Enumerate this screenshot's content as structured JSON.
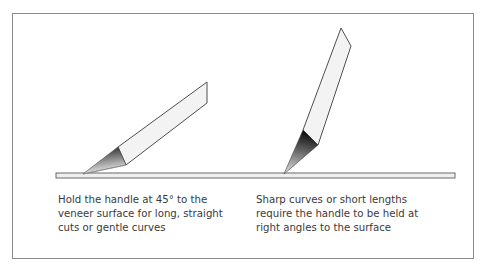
{
  "diagram": {
    "figures": [
      {
        "id": "angled-45",
        "caption_lines": [
          "Hold the handle at 45° to the",
          "veneer surface for long, straight",
          "cuts or gentle curves"
        ]
      },
      {
        "id": "right-angle",
        "caption_lines": [
          "Sharp curves or short lengths",
          "require the handle to be held at",
          "right angles to the surface"
        ]
      }
    ],
    "colors": {
      "frame": "#8a8a8a",
      "outline": "#3c3c3c",
      "handle_fill": "#f2f2f2",
      "blade_dark": "#1e1e1e",
      "blade_light": "#d8d8d8",
      "surface_fill": "#efefef",
      "text": "#3a3a3a"
    }
  }
}
